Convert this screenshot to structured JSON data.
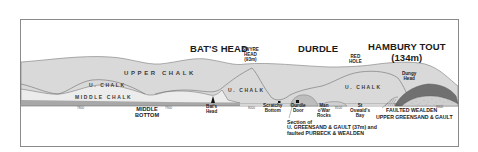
{
  "diagram": {
    "type": "geological-cross-section",
    "colors": {
      "frame": "#8a8a8a",
      "upper_chalk": "#d9d9d9",
      "middle_chalk": "#ececec",
      "lower_band": "#a8a8a8",
      "greensand_dark": "#707070",
      "wealden_stipple": "#c9c9c9",
      "outline": "#6f6f6f"
    },
    "headlands": {
      "bats_head": "BAT'S HEAD",
      "swyre_head": [
        "SWYRE",
        "HEAD",
        "(93m)"
      ],
      "durdle": "DURDLE",
      "red_hole": [
        "RED",
        "HOLE"
      ],
      "hambury_tout": [
        "HAMBURY TOUT",
        "(134m)"
      ]
    },
    "strata": {
      "upper_chalk": "UPPER CHALK",
      "u_chalk_left": "U. CHALK",
      "middle_chalk": "MIDDLE CHALK",
      "u_chalk_mid": "U. CHALK",
      "u_chalk_right": "U. CHALK",
      "dungy_head": [
        "Dungy",
        "Head"
      ]
    },
    "locations": {
      "middle_bottom": [
        "MIDDLE",
        "BOTTOM"
      ],
      "bats_head_small": [
        "Bat's",
        "Head"
      ],
      "scratchy_bottom": [
        "Scratchy",
        "Bottom"
      ],
      "durdle_door": [
        "Durdle",
        "Door"
      ],
      "man_o_war": [
        "Man",
        "o'War",
        "Rocks"
      ],
      "st_oswalds": [
        "St",
        "Oswald's",
        "Bay"
      ]
    },
    "notes": {
      "section": [
        "Section of",
        "U. GREENSAND & GAULT (37m) and",
        "faulted PURBECK & WEALDEN"
      ],
      "faulted_wealden": "FAULTED WEALDEN",
      "upper_greensand": "UPPER GREENSAND & GAULT"
    },
    "ticks": [
      "7800",
      "7900",
      "8000",
      "8100",
      "820",
      "8300"
    ]
  }
}
